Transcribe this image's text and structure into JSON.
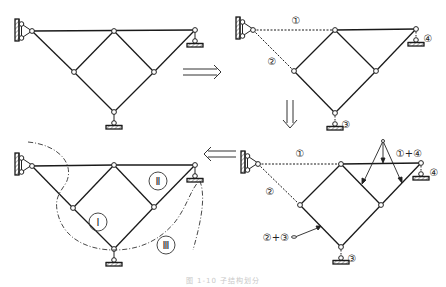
{
  "figure": {
    "caption": "图 1-10  子结构划分",
    "panels": [
      {
        "id": "original",
        "description": "Original truss with wall pin support at left, roller supports at right and bottom"
      },
      {
        "id": "decomposed",
        "description": "Truss with members released",
        "labels": [
          "①",
          "②",
          "③",
          "④"
        ]
      },
      {
        "id": "combined",
        "description": "Combined reaction/constraint labels",
        "labels": [
          "①",
          "②",
          "③",
          "④",
          "①+④",
          "②+③"
        ]
      },
      {
        "id": "substructures",
        "description": "Substructure partition",
        "labels": [
          "Ⅰ",
          "Ⅱ",
          "Ⅲ"
        ]
      }
    ],
    "arrows": [
      {
        "from": "original",
        "to": "decomposed",
        "direction": "right"
      },
      {
        "from": "decomposed",
        "to": "combined",
        "direction": "down"
      },
      {
        "from": "combined",
        "to": "substructures",
        "direction": "left"
      }
    ]
  },
  "labels": {
    "p2_1": "①",
    "p2_2": "②",
    "p2_3": "③",
    "p2_4": "④",
    "p3_1": "①",
    "p3_2": "②",
    "p3_3": "③",
    "p3_4": "④",
    "p3_14": "①+④",
    "p3_23": "②+③",
    "p4_I": "Ⅰ",
    "p4_II": "Ⅱ",
    "p4_III": "Ⅲ"
  },
  "colors": {
    "line": "#1a1a1a",
    "hatch": "#555555",
    "dashed": "#333333"
  }
}
